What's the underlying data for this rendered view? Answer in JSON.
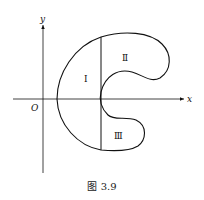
{
  "figure": {
    "caption": "图 3.9",
    "axes": {
      "x_label": "x",
      "y_label": "y",
      "origin_label": "O"
    },
    "regions": [
      {
        "id": "region-1",
        "label": "Ⅰ"
      },
      {
        "id": "region-2",
        "label": "Ⅱ"
      },
      {
        "id": "region-3",
        "label": "Ⅲ"
      }
    ],
    "colors": {
      "stroke": "#111111",
      "background": "#ffffff"
    }
  }
}
